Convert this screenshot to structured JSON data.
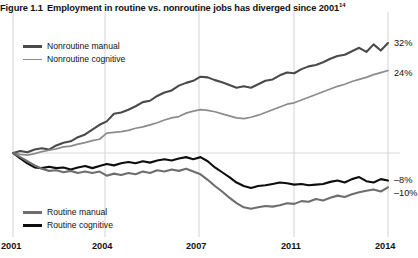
{
  "figure": {
    "number": "Figure 1.1",
    "title": "Employment in routine vs. nonroutine jobs has diverged since 2001",
    "footnote_marker": "14"
  },
  "legend_top": [
    {
      "label": "Nonroutine manual",
      "color": "#4a4a4a",
      "width": 2.6,
      "name": "legend-nonroutine-manual"
    },
    {
      "label": "Nonroutine cognitive",
      "color": "#8c8c8c",
      "width": 1.8,
      "name": "legend-nonroutine-cognitive"
    }
  ],
  "legend_bottom": [
    {
      "label": "Routine manual",
      "color": "#6e6e6e",
      "width": 2.4,
      "name": "legend-routine-manual"
    },
    {
      "label": "Routine cognitive",
      "color": "#0d0d0d",
      "width": 2.6,
      "name": "legend-routine-cognitive"
    }
  ],
  "axis": {
    "xticks": [
      "2001",
      "2004",
      "2007",
      "2011",
      "2014"
    ],
    "xtick_px": [
      13,
      105,
      199,
      294,
      388
    ],
    "endpoint_labels": [
      {
        "text": "32%",
        "y": 38,
        "name": "endpoint-label-nonroutine-manual"
      },
      {
        "text": "24%",
        "y": 68,
        "name": "endpoint-label-nonroutine-cognitive"
      },
      {
        "text": "–8%",
        "y": 175,
        "name": "endpoint-label-routine-cognitive"
      },
      {
        "text": "–10%",
        "y": 188,
        "name": "endpoint-label-routine-manual"
      }
    ]
  },
  "chart_data": {
    "type": "line",
    "title": "Employment in routine vs. nonroutine jobs has diverged since 2001",
    "xlabel": "",
    "ylabel": "Percent change in employment since 2001",
    "xlim": [
      2001,
      2014
    ],
    "ylim": [
      -18,
      36
    ],
    "grid": "vertical gridlines at 2001, 2004, 2007, 2011, 2014; faint horizontal line at 0%",
    "legend_position": "inside upper-left and inside lower-left",
    "x": [
      2001.0,
      2001.25,
      2001.5,
      2001.75,
      2002.0,
      2002.25,
      2002.5,
      2002.75,
      2003.0,
      2003.25,
      2003.5,
      2003.75,
      2004.0,
      2004.25,
      2004.5,
      2004.75,
      2005.0,
      2005.25,
      2005.5,
      2005.75,
      2006.0,
      2006.25,
      2006.5,
      2006.75,
      2007.0,
      2007.25,
      2007.5,
      2007.75,
      2008.0,
      2008.25,
      2008.5,
      2008.75,
      2009.0,
      2009.25,
      2009.5,
      2009.75,
      2010.0,
      2010.25,
      2010.5,
      2010.75,
      2011.0,
      2011.25,
      2011.5,
      2011.75,
      2012.0,
      2012.25,
      2012.5,
      2012.75,
      2013.0,
      2013.25,
      2013.5,
      2013.75,
      2014.0
    ],
    "series": [
      {
        "name": "Nonroutine manual",
        "color": "#4a4a4a",
        "end_value": 32,
        "values": [
          0,
          0.6,
          0.2,
          1.0,
          1.4,
          1.0,
          2.2,
          3.0,
          3.4,
          4.6,
          5.4,
          6.8,
          8.2,
          9.2,
          11.4,
          11.8,
          12.6,
          13.6,
          14.8,
          15.2,
          16.6,
          17.6,
          18.2,
          19.6,
          20.4,
          21.0,
          22.2,
          22.0,
          21.2,
          20.6,
          19.8,
          19.0,
          19.4,
          19.0,
          20.0,
          21.0,
          21.4,
          22.6,
          23.4,
          23.2,
          24.4,
          25.2,
          25.6,
          26.4,
          27.4,
          28.2,
          28.6,
          29.6,
          30.6,
          29.4,
          31.6,
          29.8,
          32.0
        ]
      },
      {
        "name": "Nonroutine cognitive",
        "color": "#8c8c8c",
        "end_value": 24,
        "values": [
          0,
          -0.4,
          -0.6,
          -0.2,
          0.4,
          0.8,
          1.2,
          1.8,
          2.0,
          2.6,
          3.0,
          3.6,
          4.0,
          5.8,
          6.0,
          6.2,
          6.6,
          7.2,
          7.6,
          8.2,
          8.8,
          9.6,
          10.2,
          10.6,
          11.6,
          12.2,
          12.6,
          12.4,
          12.0,
          11.4,
          10.8,
          10.2,
          10.0,
          10.4,
          11.0,
          11.8,
          12.6,
          13.4,
          14.2,
          14.6,
          15.4,
          16.2,
          17.0,
          17.8,
          18.6,
          19.4,
          20.0,
          20.8,
          21.4,
          22.0,
          22.8,
          23.4,
          24.0
        ]
      },
      {
        "name": "Routine cognitive",
        "color": "#0d0d0d",
        "end_value": -8,
        "values": [
          0,
          -1.6,
          -3.0,
          -4.2,
          -4.4,
          -4.0,
          -4.4,
          -4.2,
          -4.8,
          -4.2,
          -3.8,
          -4.4,
          -3.8,
          -3.2,
          -3.6,
          -3.0,
          -2.6,
          -3.0,
          -2.4,
          -2.8,
          -2.2,
          -1.8,
          -2.2,
          -1.6,
          -1.2,
          -1.8,
          -1.2,
          -2.4,
          -4.2,
          -5.6,
          -7.0,
          -8.6,
          -9.6,
          -10.2,
          -9.6,
          -9.4,
          -9.0,
          -8.6,
          -8.8,
          -9.2,
          -9.0,
          -9.4,
          -9.2,
          -9.0,
          -8.4,
          -8.0,
          -8.6,
          -7.6,
          -7.0,
          -8.2,
          -8.6,
          -7.6,
          -8.0
        ]
      },
      {
        "name": "Routine manual",
        "color": "#6e6e6e",
        "end_value": -10,
        "values": [
          0,
          -1.2,
          -2.4,
          -3.6,
          -4.6,
          -5.2,
          -5.0,
          -5.6,
          -5.2,
          -5.8,
          -5.4,
          -5.8,
          -5.4,
          -6.6,
          -6.0,
          -6.4,
          -5.8,
          -6.2,
          -5.4,
          -5.8,
          -5.0,
          -5.4,
          -4.8,
          -5.2,
          -4.6,
          -5.4,
          -6.2,
          -7.8,
          -9.6,
          -11.2,
          -13.0,
          -14.6,
          -15.8,
          -16.2,
          -15.8,
          -15.4,
          -15.6,
          -15.2,
          -14.6,
          -14.8,
          -14.0,
          -14.2,
          -13.4,
          -13.8,
          -13.0,
          -12.4,
          -12.8,
          -12.0,
          -11.4,
          -11.0,
          -10.6,
          -11.2,
          -10.0
        ]
      }
    ]
  }
}
